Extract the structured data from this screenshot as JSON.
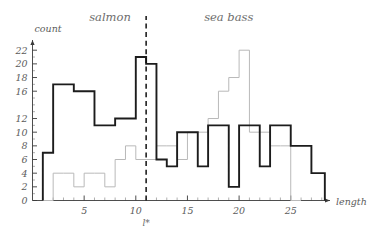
{
  "figure": {
    "background_color": "#ffffff",
    "width": 369,
    "height": 240
  },
  "labels": {
    "salmon": "salmon",
    "sea_bass": "sea bass",
    "y_axis_title": "count",
    "x_axis_title": "length",
    "threshold": "l*"
  },
  "colors": {
    "salmon_stroke": "#b9b9b9",
    "seabass_stroke": "#1c1c1c",
    "axis": "#3a3a3a",
    "tick_text": "#5c5c5c",
    "class_text": "#6d6d6d",
    "threshold": "#111111"
  },
  "chart_data": {
    "type": "bar",
    "title": "",
    "subtitle": "",
    "xlabel": "length",
    "ylabel": "count",
    "xlim": [
      0,
      28.8
    ],
    "ylim": [
      0,
      23.2
    ],
    "grid": false,
    "legend_position": "inline-annotation",
    "x_ticks_major": [
      5,
      10,
      15,
      20,
      25
    ],
    "x_ticks_major_labels": [
      "5",
      "10",
      "15",
      "20",
      "25"
    ],
    "x_tick_minor_step": 1,
    "y_ticks_major": [
      0,
      2,
      4,
      6,
      8,
      10,
      12,
      16,
      18,
      20,
      22
    ],
    "y_ticks_major_labels": [
      "0",
      "2",
      "4",
      "6",
      "8",
      "10",
      "12",
      "16",
      "18",
      "20",
      "22"
    ],
    "bin_width": 1,
    "bin_start": 1,
    "annotations": [
      {
        "text": "salmon",
        "x": 7.5,
        "y": 23.0,
        "style": "class-label"
      },
      {
        "text": "sea bass",
        "x": 19.0,
        "y": 23.0,
        "style": "class-label"
      },
      {
        "text": "l*",
        "x": 11.0,
        "y": -2.4,
        "style": "threshold-label"
      }
    ],
    "threshold_x": 11.0,
    "series": [
      {
        "name": "salmon",
        "color": "#b9b9b9",
        "emphasis": "light",
        "bin_start": 1,
        "bin_width": 1,
        "values": [
          0,
          4,
          4,
          2,
          2,
          6,
          6,
          6,
          4,
          8,
          10,
          10,
          8,
          6,
          6,
          10,
          12,
          14,
          16,
          18,
          22,
          22,
          10,
          8,
          8,
          0,
          0,
          0
        ]
      },
      {
        "name": "sea bass",
        "color": "#1c1c1c",
        "emphasis": "bold",
        "bin_start": 1,
        "bin_width": 1,
        "values": [
          7,
          7,
          17,
          17,
          16,
          16,
          11,
          10,
          12,
          12,
          21,
          21,
          20,
          6,
          6,
          8,
          10,
          10,
          2,
          2,
          11,
          11,
          11,
          4,
          4,
          11,
          11,
          8,
          8,
          3,
          3,
          2,
          2
        ]
      }
    ],
    "salmon_steps": [
      {
        "x0": 1,
        "x1": 2,
        "y": 0
      },
      {
        "x0": 2,
        "x1": 3,
        "y": 4
      },
      {
        "x0": 3,
        "x1": 4,
        "y": 4
      },
      {
        "x0": 4,
        "x1": 5,
        "y": 2
      },
      {
        "x0": 5,
        "x1": 6,
        "y": 4
      },
      {
        "x0": 6,
        "x1": 7,
        "y": 4
      },
      {
        "x0": 7,
        "x1": 8,
        "y": 2
      },
      {
        "x0": 8,
        "x1": 9,
        "y": 6
      },
      {
        "x0": 9,
        "x1": 10,
        "y": 8
      },
      {
        "x0": 10,
        "x1": 11,
        "y": 6
      },
      {
        "x0": 11,
        "x1": 12,
        "y": 6
      },
      {
        "x0": 12,
        "x1": 13,
        "y": 8
      },
      {
        "x0": 13,
        "x1": 14,
        "y": 8
      },
      {
        "x0": 14,
        "x1": 15,
        "y": 6
      },
      {
        "x0": 15,
        "x1": 16,
        "y": 10
      },
      {
        "x0": 16,
        "x1": 17,
        "y": 10
      },
      {
        "x0": 17,
        "x1": 18,
        "y": 12
      },
      {
        "x0": 18,
        "x1": 19,
        "y": 16
      },
      {
        "x0": 19,
        "x1": 20,
        "y": 18
      },
      {
        "x0": 20,
        "x1": 21,
        "y": 22
      },
      {
        "x0": 21,
        "x1": 22,
        "y": 10
      },
      {
        "x0": 22,
        "x1": 23,
        "y": 10
      },
      {
        "x0": 23,
        "x1": 24,
        "y": 8
      },
      {
        "x0": 24,
        "x1": 25,
        "y": 8
      },
      {
        "x0": 25,
        "x1": 26,
        "y": 0
      }
    ],
    "seabass_steps": [
      {
        "x0": 1,
        "x1": 2,
        "y": 7
      },
      {
        "x0": 2,
        "x1": 3,
        "y": 17
      },
      {
        "x0": 3,
        "x1": 4,
        "y": 17
      },
      {
        "x0": 4,
        "x1": 5,
        "y": 16
      },
      {
        "x0": 5,
        "x1": 6,
        "y": 16
      },
      {
        "x0": 6,
        "x1": 7,
        "y": 11
      },
      {
        "x0": 7,
        "x1": 8,
        "y": 11
      },
      {
        "x0": 8,
        "x1": 9,
        "y": 12
      },
      {
        "x0": 9,
        "x1": 10,
        "y": 12
      },
      {
        "x0": 10,
        "x1": 11,
        "y": 21
      },
      {
        "x0": 11,
        "x1": 12,
        "y": 20
      },
      {
        "x0": 12,
        "x1": 13,
        "y": 6
      },
      {
        "x0": 13,
        "x1": 14,
        "y": 5
      },
      {
        "x0": 14,
        "x1": 15,
        "y": 10
      },
      {
        "x0": 15,
        "x1": 16,
        "y": 10
      },
      {
        "x0": 16,
        "x1": 17,
        "y": 5
      },
      {
        "x0": 17,
        "x1": 18,
        "y": 11
      },
      {
        "x0": 18,
        "x1": 19,
        "y": 11
      },
      {
        "x0": 19,
        "x1": 20,
        "y": 2
      },
      {
        "x0": 20,
        "x1": 21,
        "y": 11
      },
      {
        "x0": 21,
        "x1": 22,
        "y": 11
      },
      {
        "x0": 22,
        "x1": 23,
        "y": 5
      },
      {
        "x0": 23,
        "x1": 24,
        "y": 11
      },
      {
        "x0": 24,
        "x1": 25,
        "y": 11
      },
      {
        "x0": 25,
        "x1": 26,
        "y": 8
      },
      {
        "x0": 26,
        "x1": 27,
        "y": 8
      },
      {
        "x0": 27,
        "x1": 28,
        "y": 4
      },
      {
        "x0": 28,
        "x1": 28.3,
        "y": 4
      }
    ]
  }
}
